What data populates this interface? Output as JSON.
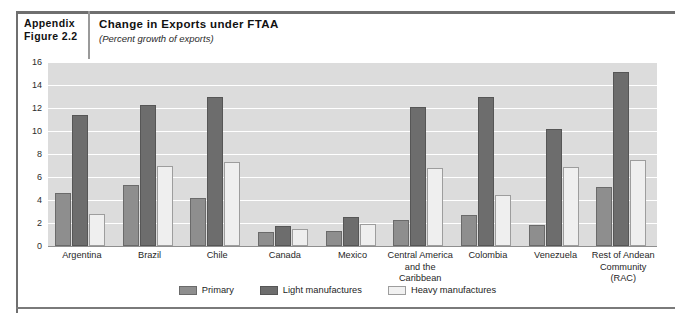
{
  "header": {
    "appendix_label": "Appendix",
    "figure_label": "Figure 2.2",
    "title": "Change in Exports under FTAA",
    "subtitle": "(Percent growth of exports)"
  },
  "legend": {
    "items": [
      {
        "label": "Primary",
        "swatch": "primary",
        "color": "#8e8e8e"
      },
      {
        "label": "Light manufactures",
        "swatch": "light",
        "color": "#6d6d6d"
      },
      {
        "label": "Heavy manufactures",
        "swatch": "heavy",
        "color": "#f1f1f1"
      }
    ]
  },
  "chart_data": {
    "type": "bar",
    "title": "Change in Exports under FTAA",
    "subtitle": "(Percent growth of exports)",
    "xlabel": "",
    "ylabel": "",
    "ylim": [
      0,
      16
    ],
    "yticks": [
      0,
      2,
      4,
      6,
      8,
      10,
      12,
      14,
      16
    ],
    "grid": true,
    "legend_position": "bottom-center",
    "categories": [
      "Argentina",
      "Brazil",
      "Chile",
      "Canada",
      "Mexico",
      "Central America and the Caribbean",
      "Colombia",
      "Venezuela",
      "Rest of Andean Community (RAC)"
    ],
    "category_lines": [
      [
        "Argentina"
      ],
      [
        "Brazil"
      ],
      [
        "Chile"
      ],
      [
        "Canada"
      ],
      [
        "Mexico"
      ],
      [
        "Central America",
        "and the Caribbean"
      ],
      [
        "Colombia"
      ],
      [
        "Venezuela"
      ],
      [
        "Rest of Andean",
        "Community (RAC)"
      ]
    ],
    "series": [
      {
        "name": "Primary",
        "values": [
          4.6,
          5.3,
          4.2,
          1.2,
          1.3,
          2.3,
          2.7,
          1.8,
          5.1
        ]
      },
      {
        "name": "Light manufactures",
        "values": [
          11.4,
          12.3,
          13.0,
          1.7,
          2.5,
          12.1,
          13.0,
          10.2,
          15.1
        ]
      },
      {
        "name": "Heavy manufactures",
        "values": [
          2.8,
          7.0,
          7.3,
          1.5,
          1.9,
          6.8,
          4.4,
          6.9,
          7.5
        ]
      }
    ]
  }
}
